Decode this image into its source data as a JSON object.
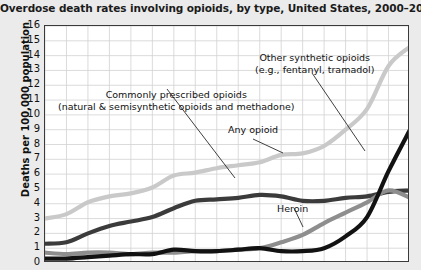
{
  "chart_data": {
    "type": "line",
    "title": "Overdose death rates involving opioids, by type, United States, 2000–2017",
    "xlabel": "",
    "ylabel": "Deaths per 100,000 population",
    "ylim": [
      0,
      16
    ],
    "xlim": [
      2000,
      2017
    ],
    "grid": true,
    "legend_position": "inline-annotations",
    "yticks": [
      "16",
      "15",
      "14",
      "13",
      "12",
      "11",
      "10",
      "9",
      "8",
      "7",
      "6",
      "5",
      "4",
      "3",
      "2",
      "1",
      "0"
    ],
    "x": [
      2000,
      2001,
      2002,
      2003,
      2004,
      2005,
      2006,
      2007,
      2008,
      2009,
      2010,
      2011,
      2012,
      2013,
      2014,
      2015,
      2016,
      2017
    ],
    "series": [
      {
        "name": "Any opioid",
        "color": "#c9c9c9",
        "values": [
          3.0,
          3.3,
          4.1,
          4.5,
          4.7,
          5.1,
          5.9,
          6.1,
          6.4,
          6.6,
          6.8,
          7.3,
          7.4,
          7.9,
          9.0,
          10.4,
          13.3,
          14.6
        ]
      },
      {
        "name": "Commonly prescribed opioids (natural & semisynthetic opioids and methadone)",
        "color": "#3b3b3b",
        "values": [
          1.3,
          1.4,
          2.0,
          2.5,
          2.8,
          3.1,
          3.7,
          4.2,
          4.3,
          4.4,
          4.6,
          4.5,
          4.2,
          4.2,
          4.4,
          4.5,
          4.8,
          4.9
        ]
      },
      {
        "name": "Heroin",
        "color": "#8e8e8e",
        "values": [
          0.7,
          0.6,
          0.7,
          0.7,
          0.6,
          0.7,
          0.7,
          0.8,
          0.8,
          0.9,
          1.0,
          1.4,
          1.9,
          2.7,
          3.4,
          4.1,
          4.9,
          4.4
        ]
      },
      {
        "name": "Other synthetic opioids (e.g., fentanyl, tramadol)",
        "color": "#121212",
        "values": [
          0.3,
          0.3,
          0.4,
          0.5,
          0.6,
          0.6,
          0.9,
          0.8,
          0.8,
          0.9,
          1.0,
          0.8,
          0.8,
          1.0,
          1.8,
          3.1,
          6.2,
          9.0
        ]
      }
    ],
    "annotations": [
      {
        "id": "synthetic",
        "line1": "Other synthetic opioids",
        "line2": "(e.g., fentanyl, tramadol)"
      },
      {
        "id": "prescribed",
        "line1": "Commonly prescribed opioids",
        "line2": "(natural & semisynthetic opioids and methadone)"
      },
      {
        "id": "any",
        "line1": "Any opioid",
        "line2": ""
      },
      {
        "id": "heroin",
        "line1": "Heroin",
        "line2": ""
      }
    ]
  }
}
